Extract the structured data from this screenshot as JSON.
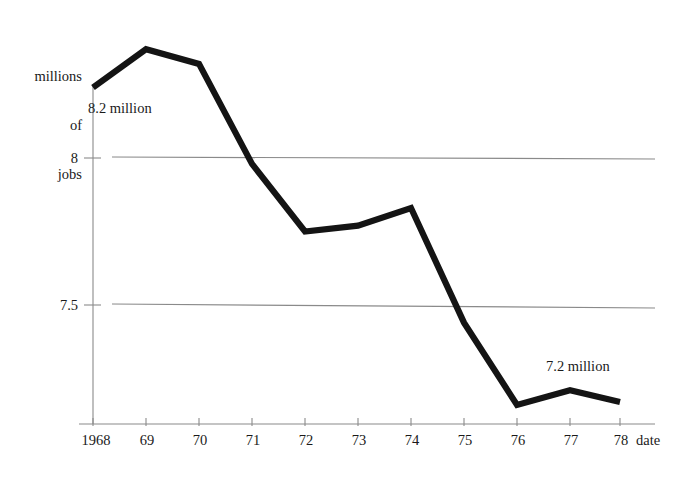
{
  "chart_data": {
    "type": "line",
    "title": "",
    "xlabel": "date",
    "ylabel": "millions of jobs",
    "ylabel_lines": [
      "millions",
      "of",
      "jobs"
    ],
    "categories": [
      "1968",
      "69",
      "70",
      "71",
      "72",
      "73",
      "74",
      "75",
      "76",
      "77",
      "78"
    ],
    "x": [
      1968,
      1969,
      1970,
      1971,
      1972,
      1973,
      1974,
      1975,
      1976,
      1977,
      1978
    ],
    "values": [
      8.24,
      8.37,
      8.32,
      7.98,
      7.75,
      7.77,
      7.83,
      7.44,
      7.16,
      7.21,
      7.17
    ],
    "series": [
      {
        "name": "jobs",
        "values": [
          8.24,
          8.37,
          8.32,
          7.98,
          7.75,
          7.77,
          7.83,
          7.44,
          7.16,
          7.21,
          7.17
        ]
      }
    ],
    "ytick_labels": [
      "8",
      "7.5"
    ],
    "ytick_values": [
      8,
      7.5
    ],
    "ylim": [
      7.05,
      8.45
    ],
    "xlim": [
      1968,
      1978
    ],
    "grid": true,
    "grid_axis": "y",
    "legend": "none",
    "annotations": [
      {
        "text": "8.2 million",
        "x": 1968.5,
        "y": 8.17
      },
      {
        "text": "7.2 million",
        "x": 1976.4,
        "y": 7.285
      }
    ],
    "line_color": "#141414",
    "grid_color": "#8a8a8a",
    "axis_color": "#8a8a8a",
    "background": "#ffffff"
  },
  "axis": {
    "y_title_line1": "millions",
    "y_title_line2": "of",
    "y_title_line3": "jobs",
    "x_axis_name": "date"
  }
}
